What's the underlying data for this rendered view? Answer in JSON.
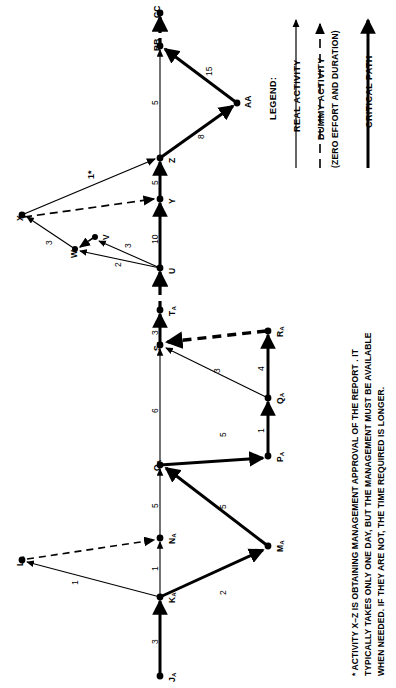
{
  "diagram": {
    "type": "pert-cpm-network",
    "orientation": "page rotated 90 degrees clockwise",
    "nodes": [
      {
        "id": "JA",
        "label": "J",
        "sub": "A",
        "x": 160,
        "y": 676
      },
      {
        "id": "KA",
        "label": "K",
        "sub": "A",
        "x": 160,
        "y": 597
      },
      {
        "id": "LA",
        "label": "L",
        "sub": "A",
        "x": 22,
        "y": 560
      },
      {
        "id": "NA",
        "label": "N",
        "sub": "A",
        "x": 160,
        "y": 538
      },
      {
        "id": "MA",
        "label": "M",
        "sub": "A",
        "x": 268,
        "y": 546
      },
      {
        "id": "OA",
        "label": "O",
        "sub": "A",
        "x": 160,
        "y": 465
      },
      {
        "id": "PA",
        "label": "P",
        "sub": "A",
        "x": 268,
        "y": 456
      },
      {
        "id": "QA",
        "label": "Q",
        "sub": "A",
        "x": 268,
        "y": 398
      },
      {
        "id": "RA",
        "label": "R",
        "sub": "A",
        "x": 268,
        "y": 331
      },
      {
        "id": "SA",
        "label": "S",
        "sub": "A",
        "x": 160,
        "y": 345
      },
      {
        "id": "TA",
        "label": "T",
        "sub": "A",
        "x": 160,
        "y": 310
      },
      {
        "id": "U",
        "label": "U",
        "sub": "",
        "x": 160,
        "y": 268
      },
      {
        "id": "V",
        "label": "V",
        "sub": "",
        "x": 95,
        "y": 237
      },
      {
        "id": "W",
        "label": "W",
        "sub": "",
        "x": 75,
        "y": 249
      },
      {
        "id": "X",
        "label": "X",
        "sub": "",
        "x": 22,
        "y": 215
      },
      {
        "id": "Y",
        "label": "Y",
        "sub": "",
        "x": 160,
        "y": 199
      },
      {
        "id": "Z",
        "label": "Z",
        "sub": "",
        "x": 160,
        "y": 158
      },
      {
        "id": "AA",
        "label": "AA",
        "sub": "",
        "x": 237,
        "y": 103
      },
      {
        "id": "BB",
        "label": "BB",
        "sub": "",
        "x": 160,
        "y": 46
      },
      {
        "id": "CC",
        "label": "CC",
        "sub": "",
        "x": 160,
        "y": 13
      }
    ],
    "activities": [
      {
        "from": "JA",
        "to": "KA",
        "duration": "3",
        "kind": "critical"
      },
      {
        "from": "KA",
        "to": "LA",
        "duration": "1",
        "kind": "real"
      },
      {
        "from": "KA",
        "to": "NA",
        "duration": "1",
        "kind": "real"
      },
      {
        "from": "LA",
        "to": "NA",
        "duration": "",
        "kind": "dummy"
      },
      {
        "from": "KA",
        "to": "MA",
        "duration": "2",
        "kind": "critical"
      },
      {
        "from": "MA",
        "to": "OA",
        "duration": "5",
        "kind": "critical"
      },
      {
        "from": "NA",
        "to": "OA",
        "duration": "5",
        "kind": "real"
      },
      {
        "from": "OA",
        "to": "PA",
        "duration": "5",
        "kind": "critical"
      },
      {
        "from": "PA",
        "to": "QA",
        "duration": "1",
        "kind": "critical"
      },
      {
        "from": "QA",
        "to": "RA",
        "duration": "4",
        "kind": "critical"
      },
      {
        "from": "QA",
        "to": "SA",
        "duration": "3",
        "kind": "real"
      },
      {
        "from": "RA",
        "to": "SA",
        "duration": "",
        "kind": "dummy-critical"
      },
      {
        "from": "OA",
        "to": "SA",
        "duration": "6",
        "kind": "real"
      },
      {
        "from": "SA",
        "to": "TA",
        "duration": "3",
        "kind": "critical"
      },
      {
        "from": "TA",
        "to": "U",
        "duration": "",
        "kind": "dummy-critical"
      },
      {
        "from": "U",
        "to": "W",
        "duration": "2",
        "kind": "real"
      },
      {
        "from": "U",
        "to": "V",
        "duration": "3",
        "kind": "real"
      },
      {
        "from": "V",
        "to": "W",
        "duration": "",
        "kind": "dummy"
      },
      {
        "from": "W",
        "to": "X",
        "duration": "3",
        "kind": "real"
      },
      {
        "from": "U",
        "to": "Y",
        "duration": "10",
        "kind": "critical"
      },
      {
        "from": "X",
        "to": "Y",
        "duration": "",
        "kind": "dummy"
      },
      {
        "from": "Y",
        "to": "Z",
        "duration": "5",
        "kind": "critical"
      },
      {
        "from": "X",
        "to": "Z",
        "duration": "1*",
        "kind": "real"
      },
      {
        "from": "Z",
        "to": "BB",
        "duration": "5",
        "kind": "real"
      },
      {
        "from": "Z",
        "to": "AA",
        "duration": "8",
        "kind": "critical"
      },
      {
        "from": "AA",
        "to": "BB",
        "duration": "15",
        "kind": "critical"
      },
      {
        "from": "BB",
        "to": "CC",
        "duration": "",
        "kind": "dummy-critical"
      }
    ],
    "duration_labels": [
      {
        "text": "3",
        "x": 150,
        "y": 639
      },
      {
        "text": "1",
        "x": 150,
        "y": 566
      },
      {
        "text": "1",
        "x": 70,
        "y": 580
      },
      {
        "text": "2",
        "x": 218,
        "y": 590
      },
      {
        "text": "5",
        "x": 218,
        "y": 504
      },
      {
        "text": "5",
        "x": 150,
        "y": 503
      },
      {
        "text": "5",
        "x": 218,
        "y": 432
      },
      {
        "text": "1",
        "x": 256,
        "y": 428
      },
      {
        "text": "4",
        "x": 256,
        "y": 366
      },
      {
        "text": "3",
        "x": 212,
        "y": 368
      },
      {
        "text": "6",
        "x": 150,
        "y": 408
      },
      {
        "text": "3",
        "x": 150,
        "y": 330
      },
      {
        "text": "2",
        "x": 113,
        "y": 262
      },
      {
        "text": "3",
        "x": 123,
        "y": 243
      },
      {
        "text": "3",
        "x": 44,
        "y": 240
      },
      {
        "text": "10",
        "x": 150,
        "y": 235
      },
      {
        "text": "5",
        "x": 150,
        "y": 180
      },
      {
        "text": "1*",
        "x": 86,
        "y": 172
      },
      {
        "text": "5",
        "x": 150,
        "y": 100
      },
      {
        "text": "8",
        "x": 196,
        "y": 134
      },
      {
        "text": "15",
        "x": 204,
        "y": 69
      }
    ]
  },
  "legend": {
    "title": "LEGEND:",
    "items": [
      {
        "label": "REAL ACTIVITY",
        "sub": "",
        "kind": "real"
      },
      {
        "label": "DUMMY ACTIVITY",
        "sub": "(ZERO EFFORT AND DURATION)",
        "kind": "dummy"
      },
      {
        "label": "CRITICAL PATH",
        "sub": "",
        "kind": "critical"
      }
    ]
  },
  "footnote": {
    "lines": [
      "* ACTIVITY X–Z IS OBTAINING MANAGEMENT APPROVAL OF THE REPORT . IT",
      "TYPICALLY TAKES ONLY ONE DAY, BUT THE MANAGEMENT MUST BE AVAILABLE",
      "WHEN NEEDED.  IF THEY ARE NOT, THE TIME REQUIRED IS LONGER."
    ]
  },
  "colors": {
    "ink": "#000000",
    "paper": "#ffffff"
  }
}
